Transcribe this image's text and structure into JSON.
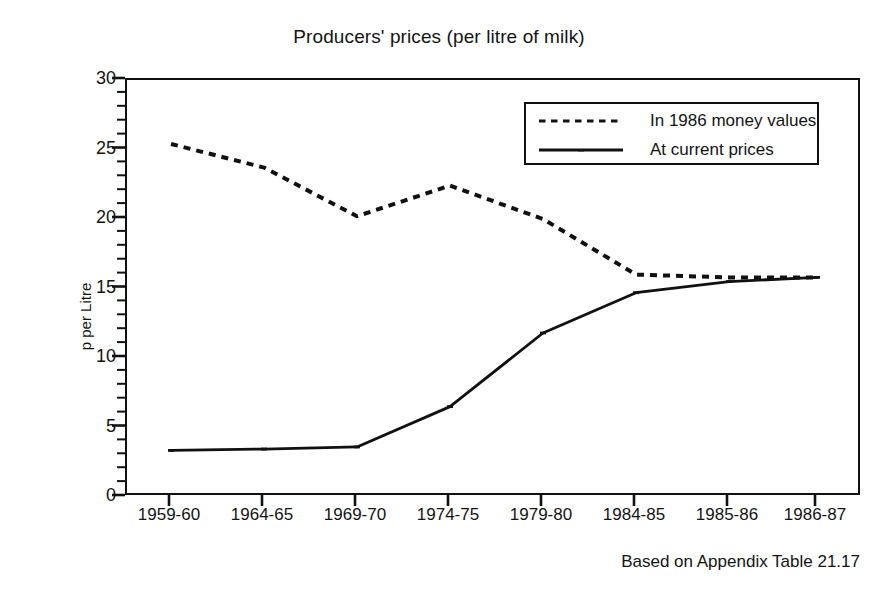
{
  "chart_data": {
    "type": "line",
    "title": "Producers' prices (per litre of milk)",
    "xlabel": "",
    "ylabel": "p per Litre",
    "ylim": [
      0,
      30
    ],
    "ytick_step": 5,
    "yticks": [
      0,
      5,
      10,
      15,
      20,
      25,
      30
    ],
    "ytick_labels": [
      "0",
      "5",
      "10",
      "15",
      "20",
      "25",
      "30"
    ],
    "minor_ytick_step": 1,
    "grid": false,
    "legend_position": "top-right",
    "categories": [
      "1959-60",
      "1964-65",
      "1969-70",
      "1974-75",
      "1979-80",
      "1984-85",
      "1985-86",
      "1986-87"
    ],
    "series": [
      {
        "name": "In 1986 money values",
        "style": "dotted",
        "color": "#111111",
        "values": [
          25.4,
          23.7,
          20.2,
          22.4,
          20.0,
          16.0,
          15.8,
          15.8
        ]
      },
      {
        "name": "At current prices",
        "style": "solid",
        "color": "#111111",
        "values": [
          3.35,
          3.45,
          3.6,
          6.5,
          11.8,
          14.7,
          15.5,
          15.8
        ]
      }
    ],
    "footnote": "Based on Appendix Table 21.17"
  },
  "legend": {
    "entries": [
      {
        "label": "In 1986 money values"
      },
      {
        "label": "At current prices"
      }
    ]
  },
  "footer": {
    "note": "Based on Appendix Table 21.17"
  }
}
